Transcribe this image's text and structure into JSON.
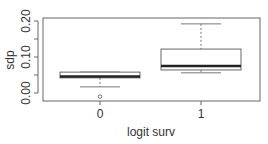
{
  "chart_data": {
    "type": "box",
    "title": "",
    "xlabel": "logit surv",
    "ylabel": "sdp",
    "categories": [
      "0",
      "1"
    ],
    "ylim": [
      0.0,
      0.21
    ],
    "yticks": [
      0.0,
      0.05,
      0.1,
      0.15,
      0.2
    ],
    "ytick_labels": [
      "0.00",
      "",
      "0.10",
      "",
      "0.20"
    ],
    "grid": false,
    "legend": null,
    "boxes": [
      {
        "group": "0",
        "lower_whisker": 0.017,
        "q1": 0.042,
        "median": 0.046,
        "q3": 0.058,
        "upper_whisker": 0.058,
        "outliers": [
          -0.01
        ]
      },
      {
        "group": "1",
        "lower_whisker": 0.056,
        "q1": 0.064,
        "median": 0.075,
        "q3": 0.122,
        "upper_whisker": 0.192,
        "outliers": []
      }
    ],
    "colors": {
      "axis": "#555555",
      "box_fill": "#ffffff",
      "median": "#222222",
      "whisker": "#777777"
    }
  }
}
